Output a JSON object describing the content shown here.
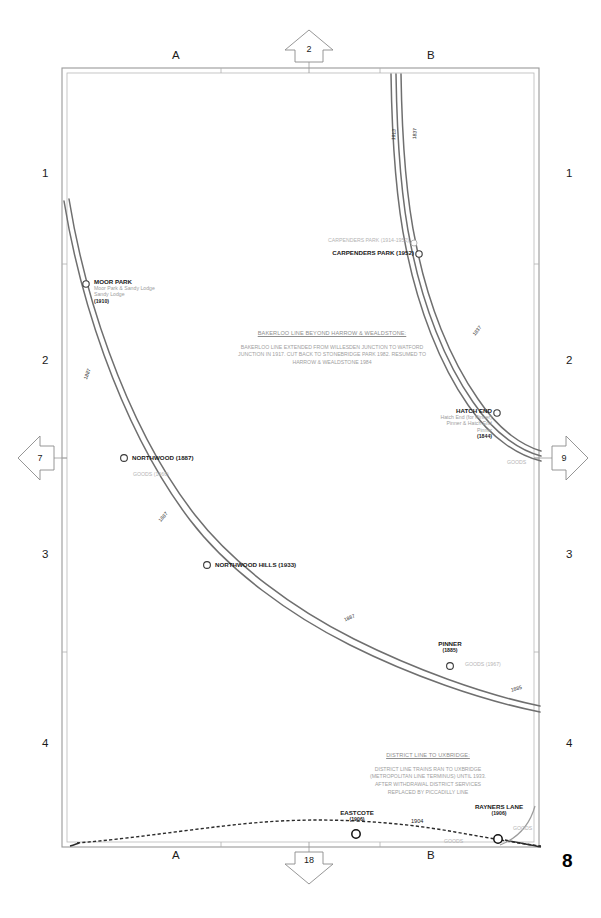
{
  "page": {
    "number": "8"
  },
  "frame": {
    "top_letters": [
      {
        "label": "A"
      },
      {
        "label": "B"
      }
    ],
    "bottom_letters": [
      {
        "label": "A"
      },
      {
        "label": "B"
      }
    ],
    "left_numbers": [
      {
        "label": "1"
      },
      {
        "label": "2"
      },
      {
        "label": "3"
      },
      {
        "label": "4"
      }
    ],
    "right_numbers": [
      {
        "label": "1"
      },
      {
        "label": "2"
      },
      {
        "label": "3"
      },
      {
        "label": "4"
      }
    ]
  },
  "connectors": {
    "top": {
      "label": "2",
      "direction": "up",
      "icon": "arrow-up-icon"
    },
    "left": {
      "label": "7",
      "direction": "left",
      "icon": "arrow-left-icon"
    },
    "right": {
      "label": "9",
      "direction": "right",
      "icon": "arrow-right-icon"
    },
    "bottom": {
      "label": "18",
      "direction": "down",
      "icon": "arrow-down-icon"
    }
  },
  "notes": [
    {
      "id": "bakerloo-note",
      "title": "BAKERLOO LINE BEYOND HARROW & WEALDSTONE:",
      "lines": [
        "BAKERLOO LINE EXTENDED FROM WILLESDEN JUNCTION TO WATFORD",
        "JUNCTION IN 1917. CUT BACK TO STONEBRIDGE PARK 1982. RESUMED TO",
        "HARROW & WEALDSTONE 1984"
      ]
    },
    {
      "id": "district-note",
      "title": "DISTRICT LINE TO UXBRIDGE:",
      "lines": [
        "DISTRICT LINE TRAINS RAN TO UXBRIDGE",
        "(METROPOLITAN LINE TERMINUS) UNTIL 1933.",
        "AFTER WITHDRAWAL DISTRICT SERVICES",
        "REPLACED BY PICCADILLY LINE"
      ]
    }
  ],
  "stations": [
    {
      "id": "moor-park",
      "name": "MOOR PARK",
      "former_names": [
        "Moor Park & Sandy Lodge",
        "Sandy Lodge"
      ],
      "opened": "(1910)",
      "goods": ""
    },
    {
      "id": "carpenders-park-old",
      "name": "CARPENDERS PARK (1914-1952)",
      "former_names": [],
      "opened": "",
      "goods": ""
    },
    {
      "id": "carpenders-park",
      "name": "CARPENDERS PARK (1952)",
      "former_names": [],
      "opened": "",
      "goods": ""
    },
    {
      "id": "hatch-end",
      "name": "HATCH END",
      "former_names": [
        "Hatch End (for Pinner)",
        "Pinner & Hatch End",
        "Pinner"
      ],
      "opened": "(1844)",
      "goods": "GOODS"
    },
    {
      "id": "northwood",
      "name": "NORTHWOOD (1887)",
      "former_names": [],
      "opened": "",
      "goods": "GOODS (1966)"
    },
    {
      "id": "northwood-hills",
      "name": "NORTHWOOD HILLS (1933)",
      "former_names": [],
      "opened": "",
      "goods": ""
    },
    {
      "id": "pinner",
      "name": "PINNER",
      "former_names": [],
      "opened": "(1885)",
      "goods": "GOODS (1967)"
    },
    {
      "id": "eastcote",
      "name": "EASTCOTE",
      "former_names": [],
      "opened": "(1906)",
      "goods": "GOODS"
    },
    {
      "id": "rayners-lane",
      "name": "RAYNERS LANE",
      "former_names": [],
      "opened": "(1906)",
      "goods": "GOODS"
    }
  ],
  "date_tags": [
    {
      "id": "tag-1913",
      "label": "1913"
    },
    {
      "id": "tag-1837-top",
      "label": "1837"
    },
    {
      "id": "tag-1837-mid",
      "label": "1837"
    },
    {
      "id": "tag-1887-moorpark",
      "label": "1887"
    },
    {
      "id": "tag-1887-northwood",
      "label": "1887"
    },
    {
      "id": "tag-1887-hills",
      "label": "1887"
    },
    {
      "id": "tag-1885-pinner",
      "label": "1885"
    },
    {
      "id": "tag-1904-district",
      "label": "1904"
    }
  ],
  "colors": {
    "rail": "#6f6f6f",
    "frame": "#9a9a9a",
    "text": "#1a1a1a",
    "muted": "#a0a0a0",
    "background": "#ffffff"
  }
}
